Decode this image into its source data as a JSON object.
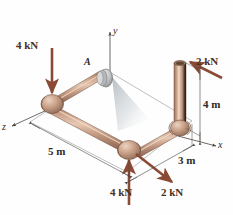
{
  "figure": {
    "background_color": "#fefefe",
    "pipe_color": "#c49a82",
    "pipe_color_dark": "#8b6350",
    "pipe_color_light": "#e3c3ae",
    "force_color": "#8a4a33",
    "dimension_color": "#4a4440",
    "axis_color": "#4a4440",
    "shadow_color": "#b9bfc2"
  },
  "axes": [
    {
      "name": "y",
      "label": "y"
    },
    {
      "name": "x",
      "label": "x"
    },
    {
      "name": "z",
      "label": "z"
    }
  ],
  "points": [
    {
      "name": "A",
      "label": "A"
    }
  ],
  "forces": [
    {
      "name": "force-top-left",
      "label": "4 kN",
      "magnitude": 4,
      "unit": "kN",
      "direction": "down"
    },
    {
      "name": "force-top-right",
      "label": "2 kN",
      "magnitude": 2,
      "unit": "kN",
      "direction": "up-left"
    },
    {
      "name": "force-bottom-left",
      "label": "4 kN",
      "magnitude": 4,
      "unit": "kN",
      "direction": "up"
    },
    {
      "name": "force-bottom-right",
      "label": "2 kN",
      "magnitude": 2,
      "unit": "kN",
      "direction": "down-right"
    }
  ],
  "dimensions": [
    {
      "name": "dimension-5m",
      "label": "5 m",
      "value": 5,
      "unit": "m"
    },
    {
      "name": "dimension-4m",
      "label": "4 m",
      "value": 4,
      "unit": "m"
    },
    {
      "name": "dimension-3m",
      "label": "3 m",
      "value": 3,
      "unit": "m"
    }
  ]
}
